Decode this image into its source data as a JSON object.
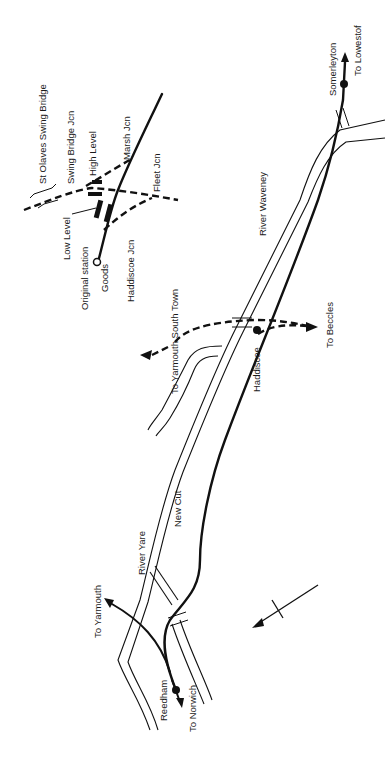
{
  "map": {
    "orientation": "rotated 90 degrees (text reads bottom-to-top)",
    "labels": {
      "st_olaves_swing_bridge": "St Olaves Swing Bridge",
      "swing_bridge_jcn": "Swing Bridge Jcn",
      "high_level": "High Level",
      "marsh_jcn": "Marsh Jcn",
      "low_level": "Low Level",
      "fleet_jcn": "Fleet Jcn",
      "original_station": "Original station",
      "goods": "Goods",
      "haddiscoe_jcn": "Haddiscoe Jcn",
      "river_waveney": "River Waveney",
      "somerleyton": "Somerleyton",
      "to_lowestof": "To Lowestof",
      "to_yarmouth_south_town": "To Yarmouth South Town",
      "haddiscoe": "Haddiscoe",
      "to_beccles": "To Beccles",
      "new_cut": "New Cut",
      "river_yare": "River Yare",
      "to_yarmouth": "To Yarmouth",
      "reedham": "Reedham",
      "to_norwich": "To Norwich"
    },
    "legend": {
      "solid_line": "open railway",
      "dashed_line": "closed railway",
      "double_thin_line": "river / waterway",
      "filled_dot": "station",
      "open_dot": "original station site"
    },
    "north_arrow": "north-arrow"
  }
}
